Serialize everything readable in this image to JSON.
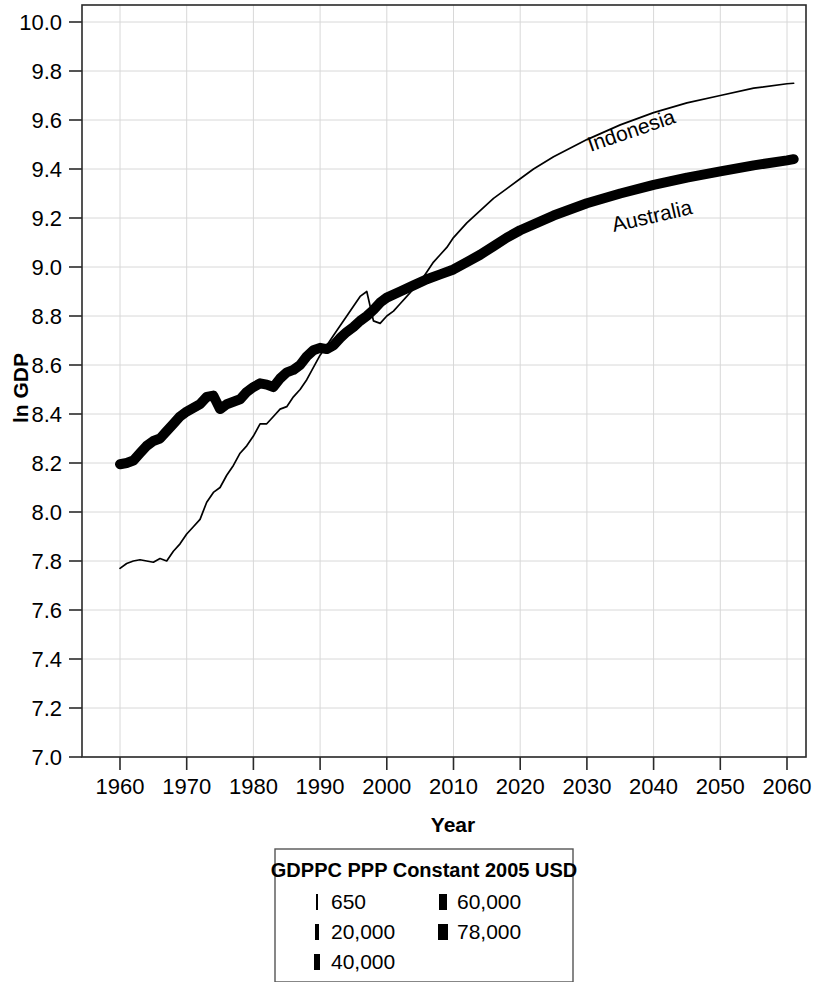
{
  "chart_data": {
    "type": "line",
    "title": "",
    "xlabel": "Year",
    "ylabel": "ln GDP",
    "xlim": [
      1955,
      2065
    ],
    "ylim": [
      7.0,
      10.0
    ],
    "grid": true,
    "xticks": [
      1960,
      1970,
      1980,
      1990,
      2000,
      2010,
      2020,
      2030,
      2040,
      2050,
      2060
    ],
    "xtick_labels": [
      "1960",
      "1970",
      "1980",
      "1990",
      "2000",
      "2010",
      "2020",
      "2030",
      "2040",
      "2050",
      "2060"
    ],
    "yticks": [
      7.0,
      7.2,
      7.4,
      7.6,
      7.8,
      8.0,
      8.2,
      8.4,
      8.6,
      8.8,
      9.0,
      9.2,
      9.4,
      9.6,
      9.8,
      10.0
    ],
    "ytick_labels": [
      "7.0",
      "7.2",
      "7.4",
      "7.6",
      "7.8",
      "8.0",
      "8.2",
      "8.4",
      "8.6",
      "8.8",
      "9.0",
      "9.2",
      "9.4",
      "9.6",
      "9.8",
      "10.0"
    ],
    "legend_position": "below-center",
    "annotations": [
      {
        "text": "Indonesia",
        "x": 2037,
        "y": 9.53,
        "rotation": -19
      },
      {
        "text": "Australia",
        "x": 2040,
        "y": 9.18,
        "rotation": -13
      }
    ],
    "series": [
      {
        "name": "Indonesia",
        "line_weight": "thin",
        "stroke_width": 1.7,
        "x": [
          1960,
          1961,
          1962,
          1963,
          1964,
          1965,
          1966,
          1967,
          1968,
          1969,
          1970,
          1971,
          1972,
          1973,
          1974,
          1975,
          1976,
          1977,
          1978,
          1979,
          1980,
          1981,
          1982,
          1983,
          1984,
          1985,
          1986,
          1987,
          1988,
          1989,
          1990,
          1991,
          1992,
          1993,
          1994,
          1995,
          1996,
          1997,
          1998,
          1999,
          2000,
          2001,
          2002,
          2003,
          2004,
          2005,
          2006,
          2007,
          2008,
          2009,
          2010,
          2012,
          2014,
          2016,
          2018,
          2020,
          2022,
          2025,
          2030,
          2035,
          2040,
          2045,
          2050,
          2055,
          2060,
          2061
        ],
        "y": [
          7.77,
          7.79,
          7.8,
          7.805,
          7.8,
          7.795,
          7.81,
          7.8,
          7.84,
          7.87,
          7.91,
          7.94,
          7.97,
          8.04,
          8.08,
          8.1,
          8.15,
          8.19,
          8.24,
          8.27,
          8.31,
          8.36,
          8.36,
          8.39,
          8.42,
          8.43,
          8.47,
          8.5,
          8.54,
          8.59,
          8.64,
          8.68,
          8.72,
          8.76,
          8.8,
          8.84,
          8.88,
          8.9,
          8.78,
          8.77,
          8.8,
          8.82,
          8.85,
          8.88,
          8.91,
          8.94,
          8.98,
          9.02,
          9.05,
          9.08,
          9.12,
          9.18,
          9.23,
          9.28,
          9.32,
          9.36,
          9.4,
          9.45,
          9.52,
          9.58,
          9.63,
          9.67,
          9.7,
          9.73,
          9.748,
          9.75
        ]
      },
      {
        "name": "Australia",
        "line_weight": "thick",
        "stroke_width": 10,
        "x": [
          1960,
          1961,
          1962,
          1963,
          1964,
          1965,
          1966,
          1967,
          1968,
          1969,
          1970,
          1971,
          1972,
          1973,
          1974,
          1975,
          1976,
          1977,
          1978,
          1979,
          1980,
          1981,
          1982,
          1983,
          1984,
          1985,
          1986,
          1987,
          1988,
          1989,
          1990,
          1991,
          1992,
          1993,
          1994,
          1995,
          1996,
          1997,
          1998,
          1999,
          2000,
          2002,
          2004,
          2006,
          2008,
          2010,
          2012,
          2014,
          2016,
          2018,
          2020,
          2025,
          2030,
          2035,
          2040,
          2045,
          2050,
          2055,
          2060,
          2061
        ],
        "y": [
          8.195,
          8.2,
          8.21,
          8.24,
          8.27,
          8.29,
          8.3,
          8.33,
          8.36,
          8.39,
          8.41,
          8.425,
          8.44,
          8.47,
          8.475,
          8.42,
          8.44,
          8.45,
          8.46,
          8.49,
          8.51,
          8.525,
          8.52,
          8.51,
          8.545,
          8.57,
          8.58,
          8.6,
          8.635,
          8.66,
          8.67,
          8.665,
          8.68,
          8.71,
          8.735,
          8.755,
          8.78,
          8.8,
          8.825,
          8.855,
          8.875,
          8.9,
          8.925,
          8.95,
          8.97,
          8.99,
          9.02,
          9.05,
          9.085,
          9.12,
          9.15,
          9.21,
          9.26,
          9.3,
          9.335,
          9.365,
          9.39,
          9.415,
          9.435,
          9.44
        ]
      }
    ]
  },
  "legend": {
    "title": "GDPPC PPP Constant 2005 USD",
    "column_left": [
      {
        "label": "650",
        "marker_width": 2
      },
      {
        "label": "20,000",
        "marker_width": 4
      },
      {
        "label": "40,000",
        "marker_width": 6
      }
    ],
    "column_right": [
      {
        "label": "60,000",
        "marker_width": 8
      },
      {
        "label": "78,000",
        "marker_width": 10
      }
    ]
  },
  "colors": {
    "line": "#000000",
    "grid": "#d8d8d8",
    "frame": "#2a2a2a",
    "background": "#ffffff"
  }
}
